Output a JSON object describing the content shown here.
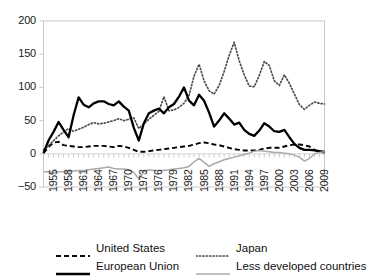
{
  "chart_data": {
    "type": "line",
    "title": "",
    "xlabel": "",
    "ylabel": "",
    "xlim": [
      1955,
      2011
    ],
    "ylim": [
      -50,
      200
    ],
    "yticks": [
      -50,
      0,
      50,
      100,
      150,
      200
    ],
    "ytick_labels": [
      "−50",
      "0",
      "50",
      "100",
      "150",
      "200"
    ],
    "xticks": [
      1955,
      1958,
      1961,
      1964,
      1967,
      1970,
      1973,
      1976,
      1979,
      1982,
      1985,
      1988,
      1991,
      1994,
      1997,
      2000,
      2003,
      2006,
      2009
    ],
    "xtick_labels": [
      "1955",
      "1958",
      "1961",
      "1964",
      "1967",
      "1970",
      "1973",
      "1976",
      "1979",
      "1982",
      "1985",
      "1988",
      "1991",
      "1994",
      "1997",
      "2000",
      "2003",
      "2006",
      "2009"
    ],
    "grid": false,
    "legend_position": "bottom",
    "x": [
      1955,
      1956,
      1957,
      1958,
      1959,
      1960,
      1961,
      1962,
      1963,
      1964,
      1965,
      1966,
      1967,
      1968,
      1969,
      1970,
      1971,
      1972,
      1973,
      1974,
      1975,
      1976,
      1977,
      1978,
      1979,
      1980,
      1981,
      1982,
      1983,
      1984,
      1985,
      1986,
      1987,
      1988,
      1989,
      1990,
      1991,
      1992,
      1993,
      1994,
      1995,
      1996,
      1997,
      1998,
      1999,
      2000,
      2001,
      2002,
      2003,
      2004,
      2005,
      2006,
      2007,
      2008,
      2009,
      2010,
      2011
    ],
    "series": [
      {
        "name": "United States",
        "style": "dashed",
        "color": "#000000",
        "values": [
          1,
          10,
          17,
          18,
          13,
          12,
          11,
          10,
          10,
          11,
          12,
          12,
          12,
          11,
          10,
          12,
          11,
          9,
          6,
          3,
          3,
          4,
          5,
          6,
          7,
          8,
          9,
          10,
          11,
          12,
          14,
          16,
          17,
          16,
          14,
          13,
          11,
          9,
          7,
          6,
          5,
          5,
          5,
          6,
          8,
          9,
          9,
          9,
          11,
          13,
          14,
          14,
          13,
          11,
          6,
          3,
          2
        ]
      },
      {
        "name": "Japan",
        "style": "dotted",
        "color": "#555555",
        "values": [
          6,
          12,
          20,
          27,
          33,
          38,
          34,
          37,
          40,
          44,
          47,
          45,
          46,
          48,
          50,
          53,
          50,
          52,
          54,
          38,
          45,
          52,
          58,
          64,
          86,
          65,
          66,
          70,
          76,
          88,
          117,
          135,
          110,
          95,
          90,
          103,
          124,
          148,
          168,
          140,
          119,
          102,
          101,
          118,
          139,
          133,
          110,
          103,
          119,
          106,
          90,
          74,
          67,
          73,
          78,
          76,
          75
        ]
      },
      {
        "name": "European Union",
        "style": "solid",
        "color": "#000000",
        "values": [
          1,
          20,
          33,
          48,
          36,
          25,
          58,
          85,
          74,
          70,
          76,
          79,
          79,
          75,
          73,
          79,
          71,
          65,
          39,
          20,
          46,
          61,
          65,
          68,
          61,
          70,
          75,
          86,
          100,
          80,
          73,
          89,
          80,
          62,
          41,
          50,
          61,
          53,
          44,
          47,
          36,
          30,
          27,
          35,
          46,
          41,
          34,
          33,
          36,
          25,
          15,
          9,
          6,
          6,
          5,
          4,
          3
        ]
      },
      {
        "name": "Less developed countries",
        "style": "solid-grey",
        "color": "#aaaaaa",
        "values": [
          -27,
          -27,
          -28,
          -27,
          -27,
          -27,
          -26,
          -25,
          -25,
          -24,
          -23,
          -22,
          -21,
          -20,
          -22,
          -23,
          -23,
          -24,
          -28,
          -38,
          -27,
          -24,
          -25,
          -25,
          -25,
          -24,
          -23,
          -22,
          -21,
          -19,
          -12,
          -7,
          -13,
          -19,
          -15,
          -12,
          -9,
          -7,
          -5,
          -3,
          -1,
          1,
          4,
          5,
          4,
          3,
          2,
          2,
          1,
          0,
          -2,
          -5,
          -11,
          -7,
          0,
          2,
          3
        ]
      }
    ]
  },
  "legend": {
    "items": [
      {
        "label": "United States",
        "style": "dashed"
      },
      {
        "label": "Japan",
        "style": "dotted"
      },
      {
        "label": "European Union",
        "style": "solid"
      },
      {
        "label": "Less developed countries",
        "style": "solid-grey"
      }
    ]
  }
}
